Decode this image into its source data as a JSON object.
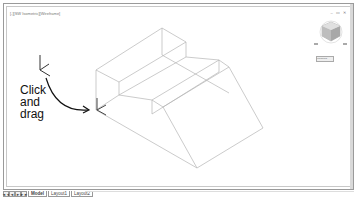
{
  "viewport": {
    "label": "[-][SW Isometric][Wireframe]",
    "window_controls": "– ▭ ✕"
  },
  "navcube": {
    "label": "Unnamed ▾"
  },
  "annotation": {
    "lines": [
      "Click",
      "and",
      "drag"
    ]
  },
  "tabbar": {
    "nav_buttons": [
      "◄◄",
      "◄",
      "►",
      "►►"
    ],
    "tabs": [
      {
        "label": "Model",
        "active": true
      },
      {
        "label": "Layout1",
        "active": false
      },
      {
        "label": "Layout2",
        "active": false
      }
    ]
  }
}
